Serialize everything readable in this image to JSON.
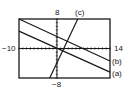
{
  "chart_data": {
    "type": "line",
    "title": "",
    "xlabel": "",
    "ylabel": "",
    "xlim": [
      -10,
      14
    ],
    "ylim": [
      -8,
      8
    ],
    "grid": false,
    "axis_ticks": {
      "x_step": 1,
      "y_step": 1
    },
    "tick_labels": {
      "x_min": "−10",
      "x_max": "14",
      "y_max": "8",
      "y_min": "−8"
    },
    "series": [
      {
        "name": "(a)",
        "points": [
          [
            -10,
            4.7
          ],
          [
            14,
            -6.4
          ]
        ]
      },
      {
        "name": "(b)",
        "points": [
          [
            -10,
            8
          ],
          [
            14,
            -3.4
          ]
        ]
      },
      {
        "name": "(c)",
        "points": [
          [
            -1.9,
            -8
          ],
          [
            5.5,
            8
          ]
        ]
      }
    ],
    "legend_position": "inline-right"
  },
  "frame": {
    "left": 19,
    "top": 19,
    "right": 110,
    "bottom": 78
  },
  "colors": {
    "line": "#1a1a1a",
    "frame": "#1a1a1a",
    "background": "#ffffff"
  }
}
